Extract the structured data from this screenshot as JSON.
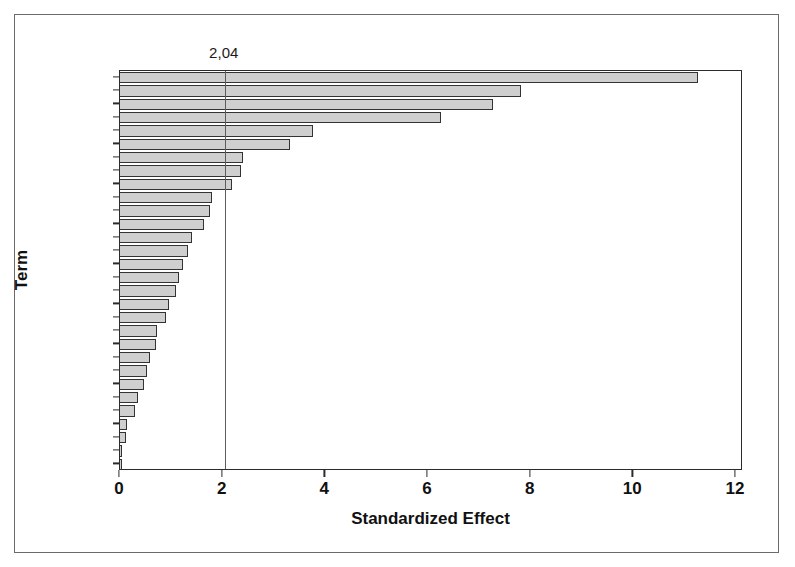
{
  "chart_data": {
    "type": "bar",
    "orientation": "horizontal",
    "title": "",
    "xlabel": "Standardized Effect",
    "ylabel": "Term",
    "xlim": [
      0,
      12
    ],
    "ylim": null,
    "grid": false,
    "legend": null,
    "x_ticks": [
      "0",
      "2",
      "4",
      "6",
      "8",
      "10",
      "12"
    ],
    "x_tick_values": [
      0,
      2,
      4,
      6,
      8,
      10,
      12
    ],
    "categories": [
      "G",
      "A",
      "H",
      "B",
      "E",
      "BG",
      "AGH",
      "ABEG",
      "AH",
      "AE",
      "BE",
      "ABGH",
      "EGH",
      "BEG",
      "ABH",
      "ABEGH",
      "ABE",
      "AEH",
      "EG",
      "EH",
      "AEG",
      "BH",
      "AEGH",
      "BEGH",
      "ABG",
      "BEH",
      "GH",
      "AB",
      "ABEH",
      "BGH"
    ],
    "values": [
      11.26,
      7.82,
      7.26,
      6.25,
      3.75,
      3.32,
      2.4,
      2.35,
      2.18,
      1.8,
      1.76,
      1.64,
      1.41,
      1.33,
      1.22,
      1.14,
      1.1,
      0.95,
      0.89,
      0.73,
      0.7,
      0.58,
      0.52,
      0.46,
      0.35,
      0.29,
      0.14,
      0.12,
      0.04,
      0.02
    ],
    "annotations": [
      {
        "name": "significance-reference-line",
        "label": "2,04",
        "value": 2.04,
        "axis": "x",
        "style": "vertical-line"
      }
    ],
    "colors": {
      "bar_fill": "#cfcfcf",
      "bar_edge": "#333333",
      "axis": "#2b2b2b",
      "reference_line": "#5d5d5d",
      "text": "#111111",
      "background": "#ffffff",
      "outer_frame": "#6a6a6a"
    }
  }
}
